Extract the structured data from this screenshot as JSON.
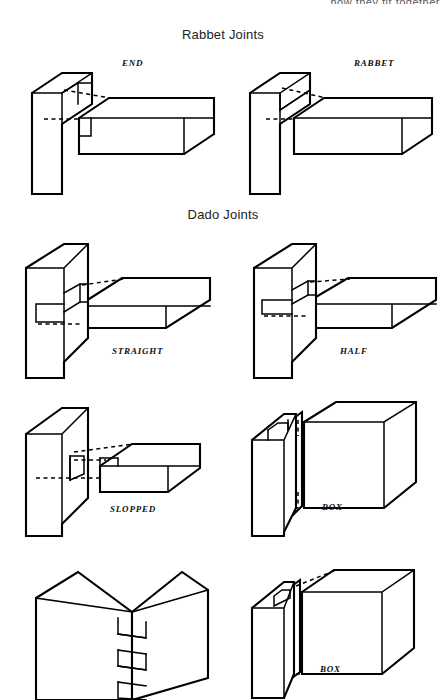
{
  "page": {
    "running_head": "how they fit together",
    "width": 446,
    "height": 697,
    "background": "#ffffff",
    "ink": "#000000"
  },
  "sections": [
    {
      "id": "rabbet",
      "heading": "Rabbet Joints"
    },
    {
      "id": "dado",
      "heading": "Dado Joints"
    }
  ],
  "figures": [
    {
      "id": "rabbet-end",
      "caption": "END",
      "section": "rabbet",
      "description": "Isometric exploded rabbet joint, vertical post with end rabbet and horizontal rail"
    },
    {
      "id": "rabbet-rabbet",
      "caption": "RABBET",
      "section": "rabbet",
      "description": "Isometric exploded rabbet joint, vertical post with side rabbet and horizontal rail"
    },
    {
      "id": "dado-straight",
      "caption": "STRAIGHT",
      "section": "dado",
      "description": "Isometric straight dado joint, grooved upright board with flat shelf board"
    },
    {
      "id": "dado-half",
      "caption": "HALF",
      "section": "dado",
      "description": "Isometric half dado joint, shallow groove with rabbeted shelf board"
    },
    {
      "id": "dado-slopped",
      "caption": "SLOPPED",
      "section": "dado",
      "description": "Isometric stopped dado joint, groove stops short of front edge, notched shelf board"
    },
    {
      "id": "dado-box-upper",
      "caption": "BOX",
      "section": "dado",
      "description": "Isometric box corner dado joint with tongue and panel"
    },
    {
      "id": "corner-finger",
      "caption": "",
      "section": "dado",
      "description": "Isometric assembled finger / box corner joint showing interlocking fingers"
    },
    {
      "id": "dado-box-lower",
      "caption": "BOX",
      "section": "dado",
      "description": "Isometric box corner joint, tongue and groove panel assembly"
    }
  ]
}
